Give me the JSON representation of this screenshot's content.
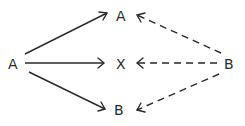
{
  "diagram": {
    "nodes": {
      "source_a": {
        "label": "A"
      },
      "target_a": {
        "label": "A"
      },
      "target_x": {
        "label": "X"
      },
      "target_b": {
        "label": "B"
      },
      "source_b": {
        "label": "B"
      }
    },
    "edges": [
      {
        "from": "A (left)",
        "to": "A (top)",
        "style": "solid"
      },
      {
        "from": "A (left)",
        "to": "X",
        "style": "solid"
      },
      {
        "from": "A (left)",
        "to": "B (bottom)",
        "style": "solid"
      },
      {
        "from": "B (right)",
        "to": "A (top)",
        "style": "dashed"
      },
      {
        "from": "B (right)",
        "to": "X",
        "style": "dashed"
      },
      {
        "from": "B (right)",
        "to": "B (bottom)",
        "style": "dashed"
      }
    ],
    "colors": {
      "ink": "#2a2a2a",
      "background": "#ffffff"
    }
  }
}
